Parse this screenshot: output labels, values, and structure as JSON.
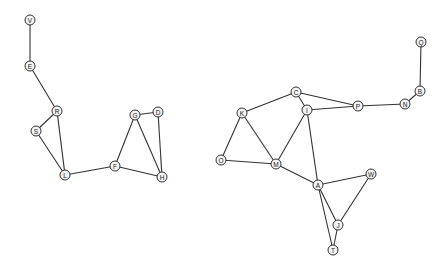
{
  "diagram": {
    "type": "undirected-graph",
    "style": {
      "edge_color": "#333333",
      "node_fill": "#f4f4f4",
      "node_stroke": "#333333",
      "node_radius": 5
    },
    "nodes": [
      {
        "id": "V",
        "label": "V",
        "x": 30,
        "y": 20
      },
      {
        "id": "E",
        "label": "E",
        "x": 30,
        "y": 66
      },
      {
        "id": "R",
        "label": "R",
        "x": 57,
        "y": 111
      },
      {
        "id": "S",
        "label": "S",
        "x": 36,
        "y": 131
      },
      {
        "id": "L",
        "label": "L",
        "x": 65,
        "y": 175
      },
      {
        "id": "F",
        "label": "F",
        "x": 115,
        "y": 166
      },
      {
        "id": "G",
        "label": "G",
        "x": 135,
        "y": 115
      },
      {
        "id": "D",
        "label": "D",
        "x": 158,
        "y": 112
      },
      {
        "id": "H",
        "label": "H",
        "x": 162,
        "y": 177
      },
      {
        "id": "K",
        "label": "K",
        "x": 242,
        "y": 113
      },
      {
        "id": "C",
        "label": "C",
        "x": 296,
        "y": 92
      },
      {
        "id": "I",
        "label": "I",
        "x": 307,
        "y": 110
      },
      {
        "id": "P",
        "label": "P",
        "x": 358,
        "y": 106
      },
      {
        "id": "N",
        "label": "N",
        "x": 405,
        "y": 104
      },
      {
        "id": "B",
        "label": "B",
        "x": 420,
        "y": 91
      },
      {
        "id": "Q",
        "label": "Q",
        "x": 421,
        "y": 42
      },
      {
        "id": "O",
        "label": "O",
        "x": 221,
        "y": 160
      },
      {
        "id": "M",
        "label": "M",
        "x": 276,
        "y": 164
      },
      {
        "id": "A",
        "label": "A",
        "x": 318,
        "y": 185
      },
      {
        "id": "W",
        "label": "W",
        "x": 371,
        "y": 174
      },
      {
        "id": "J",
        "label": "J",
        "x": 338,
        "y": 225
      },
      {
        "id": "T",
        "label": "T",
        "x": 333,
        "y": 250
      }
    ],
    "edges": [
      [
        "V",
        "E"
      ],
      [
        "E",
        "R"
      ],
      [
        "R",
        "S"
      ],
      [
        "R",
        "L"
      ],
      [
        "S",
        "L"
      ],
      [
        "L",
        "F"
      ],
      [
        "F",
        "G"
      ],
      [
        "F",
        "H"
      ],
      [
        "G",
        "D"
      ],
      [
        "G",
        "H"
      ],
      [
        "D",
        "H"
      ],
      [
        "K",
        "C"
      ],
      [
        "K",
        "O"
      ],
      [
        "K",
        "M"
      ],
      [
        "O",
        "M"
      ],
      [
        "C",
        "I"
      ],
      [
        "C",
        "P"
      ],
      [
        "I",
        "P"
      ],
      [
        "I",
        "M"
      ],
      [
        "I",
        "A"
      ],
      [
        "M",
        "A"
      ],
      [
        "A",
        "W"
      ],
      [
        "A",
        "J"
      ],
      [
        "A",
        "T"
      ],
      [
        "J",
        "T"
      ],
      [
        "J",
        "W"
      ],
      [
        "P",
        "N"
      ],
      [
        "N",
        "B"
      ],
      [
        "B",
        "Q"
      ]
    ]
  }
}
